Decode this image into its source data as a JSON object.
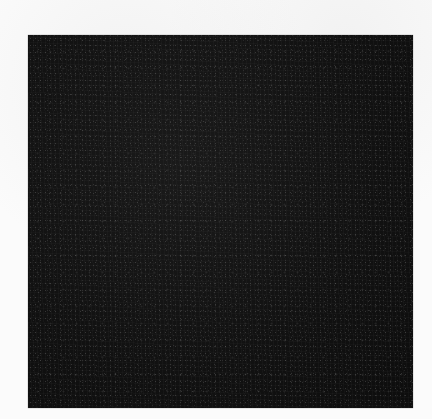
{
  "scene": {
    "description": "Photograph of a black textured square swatch on a white background",
    "background_color": "#fbfbfb",
    "swatch": {
      "label": "Black textured swatch",
      "color": "#121212",
      "bounds": {
        "x": 28,
        "y": 35,
        "width": 385,
        "height": 373
      }
    }
  }
}
